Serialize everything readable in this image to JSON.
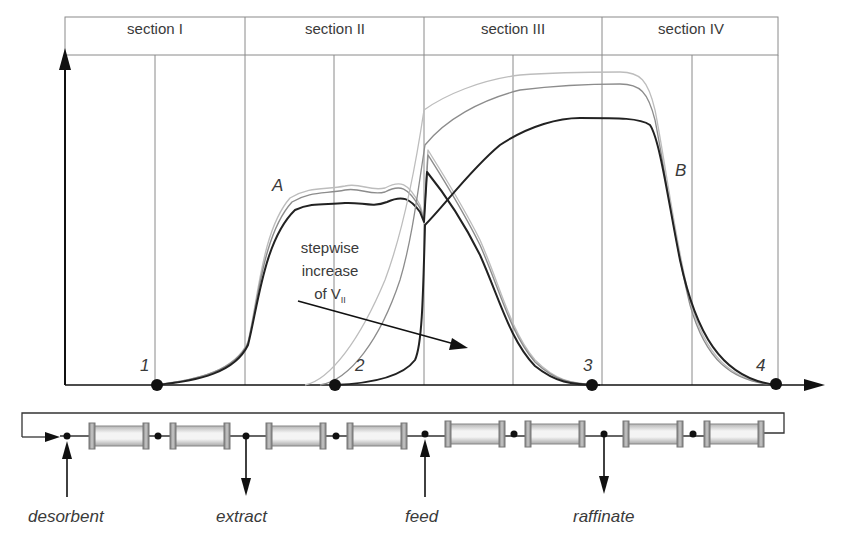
{
  "diagram": {
    "title": "",
    "sections": [
      {
        "id": "I",
        "label": "section I"
      },
      {
        "id": "II",
        "label": "section II"
      },
      {
        "id": "III",
        "label": "section III"
      },
      {
        "id": "IV",
        "label": "section IV"
      }
    ],
    "curve_labels": {
      "a": "A",
      "b": "B"
    },
    "points": [
      {
        "id": "1",
        "label": "1"
      },
      {
        "id": "2",
        "label": "2"
      },
      {
        "id": "3",
        "label": "3"
      },
      {
        "id": "4",
        "label": "4"
      }
    ],
    "annotation": {
      "line1": "stepwise",
      "line2": "increase",
      "line3_prefix": "of V",
      "line3_sub": "II"
    },
    "ports": {
      "desorbent": "desorbent",
      "extract": "extract",
      "feed": "feed",
      "raffinate": "raffinate"
    },
    "column_count": 8,
    "colors": {
      "axis": "#111111",
      "grid": "#8a8a8a",
      "curve_dark": "#222222",
      "curve_mid": "#8c8c8c",
      "curve_light": "#bdbdbd",
      "column_fill": "#e6e6e6",
      "column_cap": "#9a9a9a"
    }
  }
}
